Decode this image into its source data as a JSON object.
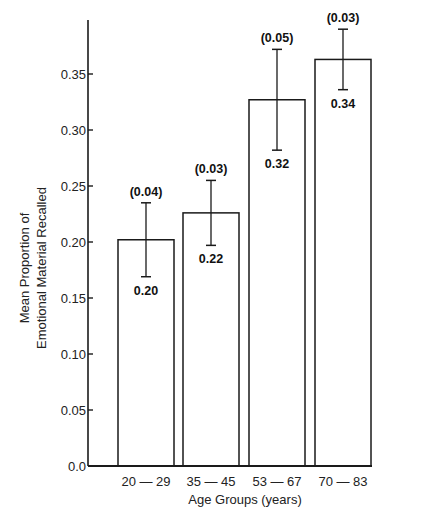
{
  "chart_data": {
    "type": "bar",
    "title": "",
    "xlabel": "Age Groups (years)",
    "ylabel": [
      "Mean Proportion of",
      "Emotional Material Recalled"
    ],
    "categories": [
      "20 — 29",
      "35 — 45",
      "53 — 67",
      "70 — 83"
    ],
    "values": [
      0.202,
      0.226,
      0.327,
      0.363
    ],
    "value_labels": [
      "0.20",
      "0.22",
      "0.32",
      "0.34"
    ],
    "error": [
      0.033,
      0.029,
      0.045,
      0.027
    ],
    "error_labels": [
      "(0.04)",
      "(0.03)",
      "(0.05)",
      "(0.03)"
    ],
    "ylim": [
      0,
      0.4
    ],
    "yticks": [
      0.0,
      0.05,
      0.1,
      0.15,
      0.2,
      0.25,
      0.3,
      0.35
    ],
    "ytick_labels": [
      "0.0",
      "0.05",
      "0.10",
      "0.15",
      "0.20",
      "0.25",
      "0.30",
      "0.35"
    ],
    "grid": false,
    "legend": null,
    "bar_fill": "#ffffff",
    "bar_stroke": "#1a1a1a"
  }
}
